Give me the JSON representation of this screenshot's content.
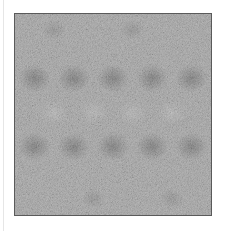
{
  "canvas": {
    "width": 226,
    "height": 231,
    "background": "#ffffff"
  },
  "texture_panel": {
    "description": "grayscale noise texture with periodic dark blotches",
    "base_color": "#a8a8a8",
    "border_color": "#5a5a5a",
    "blotch_rows": 2,
    "blotch_columns": 5
  }
}
